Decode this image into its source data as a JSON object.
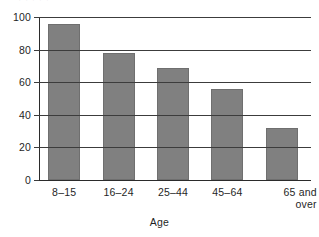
{
  "figure": {
    "cropped_title_remnant": "· · · · ·",
    "background_color": "#ffffff",
    "bar_color": "#808080",
    "axis_color": "#2b2b2b"
  },
  "chart_data": {
    "type": "bar",
    "title": "",
    "xlabel": "Age",
    "ylabel": "",
    "categories": [
      "8–15",
      "16–24",
      "25–44",
      "45–64",
      "65 and\nover"
    ],
    "values": [
      96,
      78,
      69,
      56,
      32
    ],
    "ylim": [
      0,
      100
    ],
    "yticks": [
      0,
      20,
      40,
      60,
      80,
      100
    ],
    "ytick_labels": [
      "0",
      "20",
      "40",
      "60",
      "80",
      "100"
    ],
    "grid": "horizontal",
    "legend": "none",
    "series": [
      {
        "name": "Percent",
        "values": [
          96,
          78,
          69,
          56,
          32
        ]
      }
    ]
  }
}
